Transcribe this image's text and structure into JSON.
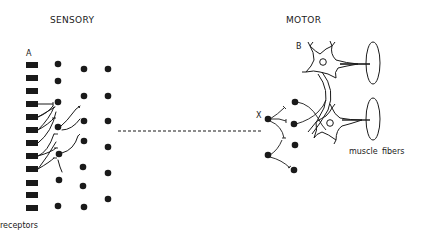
{
  "diagram": {
    "type": "neural-circuit",
    "labels": {
      "sensory": "SENSORY",
      "motor": "MOTOR",
      "point_a": "A",
      "point_b": "B",
      "point_x": "X",
      "receptors": "receptors",
      "muscle": "muscle",
      "fibers": "fibers"
    },
    "nodes": {
      "receptors_count": 12,
      "sensory_column_1_count": 7,
      "sensory_column_2_count": 7,
      "sensory_column_3_count": 6,
      "motor_interneurons_count": 6,
      "motor_neurons_count": 2,
      "muscle_fibers_count": 2
    },
    "edges": [
      {
        "from": "sensory",
        "to": "motor",
        "style": "dashed"
      },
      {
        "from": "motor-neuron-B",
        "to": "muscle-fiber-1",
        "style": "solid"
      },
      {
        "from": "motor-neuron-lower",
        "to": "muscle-fiber-2",
        "style": "solid"
      }
    ],
    "colors": {
      "ink": "#1a1a1a",
      "background": "#ffffff"
    }
  }
}
